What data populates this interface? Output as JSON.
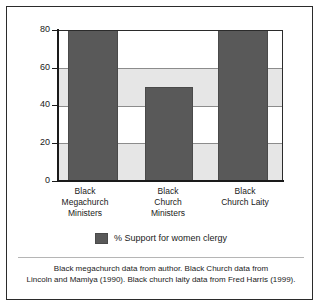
{
  "chart_data": {
    "type": "bar",
    "title": "",
    "subtitle": "",
    "xlabel": "",
    "ylabel": "",
    "ylim": [
      0,
      80
    ],
    "yticks": [
      0,
      20,
      40,
      60,
      80
    ],
    "ytick_labels": [
      "0",
      "20",
      "40",
      "60",
      "80"
    ],
    "grid": true,
    "grid_axis": "y",
    "legend_position": "bottom-center",
    "categories": [
      "Black Megachurch Ministers",
      "Black Church Ministers",
      "Black Church Laity"
    ],
    "category_label_lines": [
      [
        "Black",
        "Megachurch",
        "Ministers"
      ],
      [
        "Black",
        "Church",
        "Ministers"
      ],
      [
        "Black",
        "Church Laity"
      ]
    ],
    "series": [
      {
        "name": "% Support for women clergy",
        "values": [
          80,
          50,
          80
        ],
        "color": "#595959"
      }
    ],
    "legend": [
      "% Support for women clergy"
    ],
    "caption_lines": [
      "Black megachurch data from author. Black Church data from",
      "Lincoln and Mamiya (1990). Black church laity data from Fred Harris (1999)."
    ]
  },
  "colors": {
    "bar_fill": "#595959",
    "band_shade": "#e6e6e6",
    "plot_background": "#ffffff",
    "gridline": "#8c8c8c",
    "axis": "#1a1a1a",
    "frame": "#2b2b2b",
    "text": "#1a1a1a"
  },
  "axis": {
    "y_labels": [
      "80",
      "60",
      "40",
      "20",
      "0"
    ]
  },
  "legend": {
    "label": "% Support for women clergy"
  },
  "caption": {
    "line1": "Black megachurch data from author. Black Church data from",
    "line2": "Lincoln and Mamiya (1990). Black church laity data from Fred Harris (1999)."
  },
  "xlabels": {
    "cat0_line0": "Black",
    "cat0_line1": "Megachurch",
    "cat0_line2": "Ministers",
    "cat1_line0": "Black",
    "cat1_line1": "Church",
    "cat1_line2": "Ministers",
    "cat2_line0": "Black",
    "cat2_line1": "Church Laity"
  }
}
